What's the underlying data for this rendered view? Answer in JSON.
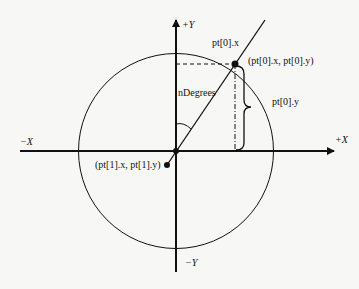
{
  "diagram": {
    "axes": {
      "pos_x_label": "+X",
      "neg_x_label": "−X",
      "pos_y_label": "+Y",
      "neg_y_label": "−Y"
    },
    "labels": {
      "pt0_x": "pt[0].x",
      "pt0_coords": "(pt[0].x, pt[0].y)",
      "pt0_y": "pt[0].y",
      "angle": "nDegrees",
      "pt1_coords": "(pt[1].x, pt[1].y)"
    },
    "colors": {
      "background": "#f7f7f5",
      "stroke": "#111111"
    }
  }
}
